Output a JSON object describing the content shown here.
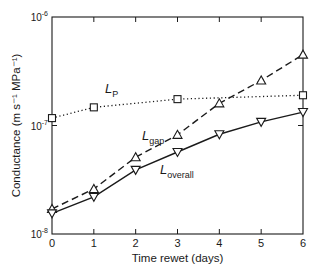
{
  "chart_data": {
    "type": "line",
    "title": "",
    "xlabel": "Time rewet  (days)",
    "ylabel": "Conductance  (m s⁻¹ MPa⁻¹)",
    "yscale": "log",
    "xlim": [
      0,
      6
    ],
    "ylim": [
      1e-08,
      1e-06
    ],
    "x_ticks": [
      "0",
      "1",
      "2",
      "3",
      "4",
      "5",
      "6"
    ],
    "y_ticks": [
      {
        "base": "10",
        "exp": "-8"
      },
      {
        "base": "10",
        "exp": "-7"
      },
      {
        "base": "10",
        "exp": "-6"
      }
    ],
    "grid": false,
    "legend": "inline labels",
    "series": [
      {
        "name": "L_P",
        "label_main": "L",
        "label_sub": "P",
        "style": "dotted",
        "marker": "square",
        "x": [
          0,
          1,
          3,
          6
        ],
        "values": [
          1.17e-07,
          1.47e-07,
          1.75e-07,
          1.9e-07
        ]
      },
      {
        "name": "L_gap",
        "label_main": "L",
        "label_sub": "gap",
        "style": "dashed",
        "marker": "triangle-up",
        "x": [
          0,
          1,
          2,
          3,
          4,
          5,
          6
        ],
        "values": [
          1.7e-08,
          2.6e-08,
          5.1e-08,
          8.2e-08,
          1.6e-07,
          2.6e-07,
          4.5e-07
        ]
      },
      {
        "name": "L_overall",
        "label_main": "L",
        "label_sub": "overall",
        "style": "solid",
        "marker": "triangle-down",
        "x": [
          0,
          1,
          2,
          3,
          4,
          5,
          6
        ],
        "values": [
          1.55e-08,
          2.2e-08,
          3.9e-08,
          5.7e-08,
          8.3e-08,
          1.08e-07,
          1.33e-07
        ]
      }
    ]
  },
  "caption": "Changes in conductance over the time rewet after drought (partially cut off)"
}
